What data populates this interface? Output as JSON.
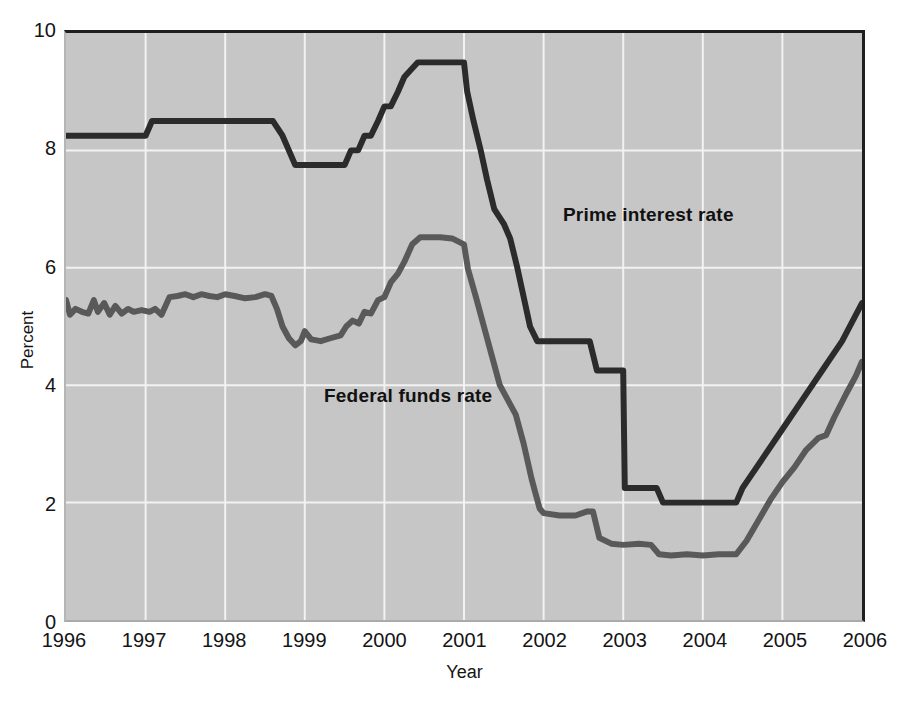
{
  "chart_data": {
    "type": "line",
    "title": "",
    "xlabel": "Year",
    "ylabel": "Percent",
    "xlim": [
      1996,
      2006
    ],
    "ylim": [
      0,
      10
    ],
    "grid": true,
    "legend_position": "inline-annotations",
    "x_ticks": [
      "1996",
      "1997",
      "1998",
      "1999",
      "2000",
      "2001",
      "2002",
      "2003",
      "2004",
      "2005",
      "2006"
    ],
    "y_ticks": [
      "10",
      "8",
      "6",
      "4",
      "2",
      "0"
    ],
    "series": [
      {
        "name": "Prime interest rate",
        "color": "#2b2b2b",
        "label_x": 2002.4,
        "label_y": 7.3,
        "points": [
          [
            1996.0,
            8.25
          ],
          [
            1996.92,
            8.25
          ],
          [
            1997.0,
            8.25
          ],
          [
            1997.08,
            8.5
          ],
          [
            1997.25,
            8.5
          ],
          [
            1998.0,
            8.5
          ],
          [
            1998.6,
            8.5
          ],
          [
            1998.72,
            8.25
          ],
          [
            1998.8,
            8.0
          ],
          [
            1998.88,
            7.75
          ],
          [
            1999.0,
            7.75
          ],
          [
            1999.5,
            7.75
          ],
          [
            1999.58,
            8.0
          ],
          [
            1999.67,
            8.0
          ],
          [
            1999.75,
            8.25
          ],
          [
            1999.83,
            8.25
          ],
          [
            1999.92,
            8.5
          ],
          [
            2000.0,
            8.75
          ],
          [
            2000.08,
            8.75
          ],
          [
            2000.17,
            9.0
          ],
          [
            2000.25,
            9.25
          ],
          [
            2000.42,
            9.5
          ],
          [
            2000.5,
            9.5
          ],
          [
            2001.0,
            9.5
          ],
          [
            2001.04,
            9.0
          ],
          [
            2001.12,
            8.5
          ],
          [
            2001.21,
            8.0
          ],
          [
            2001.29,
            7.5
          ],
          [
            2001.38,
            7.0
          ],
          [
            2001.5,
            6.75
          ],
          [
            2001.58,
            6.5
          ],
          [
            2001.67,
            6.0
          ],
          [
            2001.75,
            5.5
          ],
          [
            2001.83,
            5.0
          ],
          [
            2001.92,
            4.75
          ],
          [
            2002.0,
            4.75
          ],
          [
            2002.5,
            4.75
          ],
          [
            2002.58,
            4.75
          ],
          [
            2002.67,
            4.25
          ],
          [
            2002.83,
            4.25
          ],
          [
            2002.92,
            4.25
          ],
          [
            2003.0,
            4.25
          ],
          [
            2003.02,
            2.25
          ],
          [
            2003.42,
            2.25
          ],
          [
            2003.5,
            2.0
          ],
          [
            2004.0,
            2.0
          ],
          [
            2004.42,
            2.0
          ],
          [
            2004.5,
            2.25
          ],
          [
            2004.75,
            2.75
          ],
          [
            2005.0,
            3.25
          ],
          [
            2005.25,
            3.75
          ],
          [
            2005.5,
            4.25
          ],
          [
            2005.75,
            4.75
          ],
          [
            2006.0,
            5.4
          ]
        ]
      },
      {
        "name": "Federal funds rate",
        "color": "#595959",
        "label_x": 1998.4,
        "label_y": 4.55,
        "points": [
          [
            1996.0,
            5.45
          ],
          [
            1996.05,
            5.2
          ],
          [
            1996.12,
            5.3
          ],
          [
            1996.2,
            5.25
          ],
          [
            1996.28,
            5.22
          ],
          [
            1996.35,
            5.45
          ],
          [
            1996.4,
            5.25
          ],
          [
            1996.48,
            5.4
          ],
          [
            1996.55,
            5.2
          ],
          [
            1996.62,
            5.35
          ],
          [
            1996.7,
            5.22
          ],
          [
            1996.78,
            5.3
          ],
          [
            1996.85,
            5.25
          ],
          [
            1996.95,
            5.28
          ],
          [
            1997.05,
            5.25
          ],
          [
            1997.12,
            5.3
          ],
          [
            1997.2,
            5.2
          ],
          [
            1997.3,
            5.5
          ],
          [
            1997.4,
            5.52
          ],
          [
            1997.5,
            5.55
          ],
          [
            1997.6,
            5.5
          ],
          [
            1997.7,
            5.55
          ],
          [
            1997.8,
            5.52
          ],
          [
            1997.9,
            5.5
          ],
          [
            1998.0,
            5.55
          ],
          [
            1998.12,
            5.52
          ],
          [
            1998.25,
            5.48
          ],
          [
            1998.38,
            5.5
          ],
          [
            1998.5,
            5.55
          ],
          [
            1998.58,
            5.52
          ],
          [
            1998.65,
            5.3
          ],
          [
            1998.72,
            5.0
          ],
          [
            1998.8,
            4.8
          ],
          [
            1998.88,
            4.68
          ],
          [
            1998.95,
            4.75
          ],
          [
            1999.0,
            4.92
          ],
          [
            1999.08,
            4.78
          ],
          [
            1999.2,
            4.75
          ],
          [
            1999.32,
            4.8
          ],
          [
            1999.45,
            4.85
          ],
          [
            1999.52,
            5.0
          ],
          [
            1999.6,
            5.1
          ],
          [
            1999.68,
            5.05
          ],
          [
            1999.75,
            5.25
          ],
          [
            1999.83,
            5.22
          ],
          [
            1999.92,
            5.45
          ],
          [
            2000.0,
            5.5
          ],
          [
            2000.08,
            5.75
          ],
          [
            2000.17,
            5.9
          ],
          [
            2000.25,
            6.1
          ],
          [
            2000.35,
            6.4
          ],
          [
            2000.45,
            6.52
          ],
          [
            2000.55,
            6.52
          ],
          [
            2000.7,
            6.52
          ],
          [
            2000.85,
            6.5
          ],
          [
            2001.0,
            6.4
          ],
          [
            2001.05,
            5.98
          ],
          [
            2001.15,
            5.5
          ],
          [
            2001.25,
            5.0
          ],
          [
            2001.35,
            4.5
          ],
          [
            2001.45,
            4.0
          ],
          [
            2001.55,
            3.75
          ],
          [
            2001.65,
            3.5
          ],
          [
            2001.75,
            3.0
          ],
          [
            2001.85,
            2.4
          ],
          [
            2001.95,
            1.9
          ],
          [
            2002.0,
            1.82
          ],
          [
            2002.2,
            1.78
          ],
          [
            2002.4,
            1.78
          ],
          [
            2002.55,
            1.85
          ],
          [
            2002.62,
            1.85
          ],
          [
            2002.7,
            1.4
          ],
          [
            2002.85,
            1.3
          ],
          [
            2003.0,
            1.28
          ],
          [
            2003.2,
            1.3
          ],
          [
            2003.35,
            1.28
          ],
          [
            2003.45,
            1.12
          ],
          [
            2003.6,
            1.1
          ],
          [
            2003.8,
            1.12
          ],
          [
            2004.0,
            1.1
          ],
          [
            2004.2,
            1.12
          ],
          [
            2004.42,
            1.12
          ],
          [
            2004.55,
            1.35
          ],
          [
            2004.7,
            1.7
          ],
          [
            2004.85,
            2.05
          ],
          [
            2005.0,
            2.35
          ],
          [
            2005.15,
            2.6
          ],
          [
            2005.3,
            2.9
          ],
          [
            2005.45,
            3.1
          ],
          [
            2005.55,
            3.15
          ],
          [
            2005.65,
            3.45
          ],
          [
            2005.8,
            3.85
          ],
          [
            2005.92,
            4.15
          ],
          [
            2006.0,
            4.4
          ]
        ]
      }
    ]
  },
  "axes": {
    "y_label": "Percent",
    "x_label": "Year",
    "y_ticks": [
      "10",
      "8",
      "6",
      "4",
      "2",
      "0"
    ],
    "x_ticks": [
      "1996",
      "1997",
      "1998",
      "1999",
      "2000",
      "2001",
      "2002",
      "2003",
      "2004",
      "2005",
      "2006"
    ]
  },
  "annotations": {
    "prime": "Prime interest rate",
    "fedfunds": "Federal funds rate"
  },
  "colors": {
    "plot_background": "#c6c6c6",
    "gridline": "#f2f2f2",
    "frame": "#1f1f1f",
    "prime_line": "#2b2b2b",
    "fedfunds_line": "#595959",
    "text": "#141414"
  }
}
